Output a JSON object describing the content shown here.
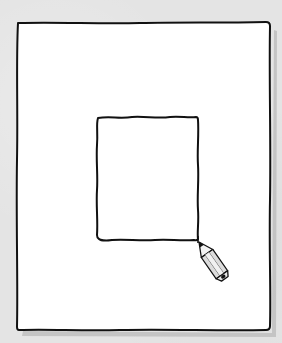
{
  "illustration": {
    "subject": "hand-drawn page with inner rectangle being drawn by pencil",
    "background_color": "#e4e4e4",
    "page_color": "#ffffff",
    "stroke_color": "#111111",
    "shadow_color": "#b8b8b8",
    "outer_frame": {
      "x": 17,
      "y": 22,
      "width": 253,
      "height": 308
    },
    "inner_frame": {
      "x": 97,
      "y": 117,
      "width": 101,
      "height": 123
    },
    "pencil": {
      "icon": "pencil-icon",
      "tip": {
        "x": 199,
        "y": 242
      },
      "end": {
        "x": 232,
        "y": 284
      },
      "body_color": "#d9d9d9",
      "wood_color": "#efefef"
    }
  }
}
